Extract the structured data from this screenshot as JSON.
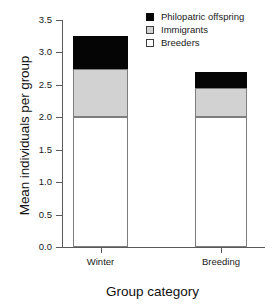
{
  "chart_data": {
    "type": "bar",
    "stacked": true,
    "title": "",
    "xlabel": "Group category",
    "ylabel": "Mean individuals per group",
    "categories": [
      "Winter",
      "Breeding"
    ],
    "ylim": [
      0.0,
      3.5
    ],
    "yticks": [
      "0.0",
      "0.5",
      "1.0",
      "1.5",
      "2.0",
      "2.5",
      "3.0",
      "3.5"
    ],
    "ytick_values": [
      0.0,
      0.5,
      1.0,
      1.5,
      2.0,
      2.5,
      3.0,
      3.5
    ],
    "grid": false,
    "legend_position": "top-right",
    "series": [
      {
        "name": "Philopatric offspring",
        "values": [
          0.5,
          0.25
        ],
        "color": "#050505"
      },
      {
        "name": "Immigrants",
        "values": [
          0.75,
          0.45
        ],
        "color": "#d2d2d2"
      },
      {
        "name": "Breeders",
        "values": [
          2.0,
          2.0
        ],
        "color": "#ffffff"
      }
    ],
    "totals": [
      3.25,
      2.7
    ],
    "cumulative_tops": {
      "Winter": {
        "breeders": 2.0,
        "immigrants": 2.75,
        "philopatric": 3.25
      },
      "Breeding": {
        "breeders": 2.0,
        "immigrants": 2.45,
        "philopatric": 2.7
      }
    }
  },
  "legend": {
    "items": [
      {
        "label": "Philopatric offspring"
      },
      {
        "label": "Immigrants"
      },
      {
        "label": "Breeders"
      }
    ]
  }
}
